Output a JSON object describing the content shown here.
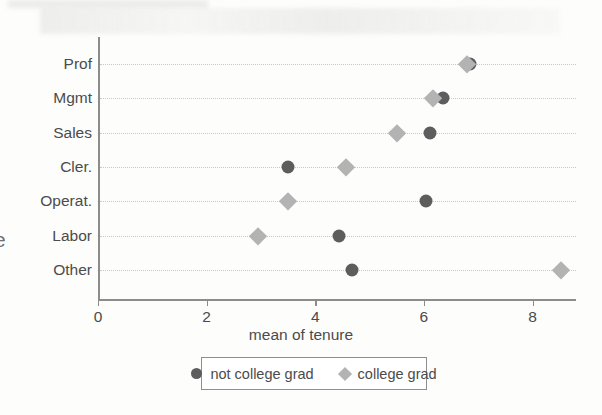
{
  "figure": {
    "left_margin_glyph": "e",
    "background_color": "#fdfdfc"
  },
  "legend": {
    "items": [
      {
        "label": "not college grad",
        "marker": "circle-marker",
        "color": "#5d5d5d"
      },
      {
        "label": "college grad",
        "marker": "diamond-marker",
        "color": "#b3b3b3"
      }
    ]
  },
  "chart_data": {
    "type": "scatter",
    "orientation": "horizontal",
    "title": "",
    "xlabel": "mean of tenure",
    "ylabel": "",
    "categories": [
      "Prof",
      "Mgmt",
      "Sales",
      "Cler.",
      "Operat.",
      "Labor",
      "Other"
    ],
    "xlim": [
      0,
      8.8
    ],
    "xticks": [
      0,
      2,
      4,
      6,
      8
    ],
    "xticklabels": [
      "0",
      "2",
      "4",
      "6",
      "8"
    ],
    "grid": "horizontal-dotted",
    "legend_position": "below-axis",
    "series": [
      {
        "name": "not college grad",
        "marker": "circle",
        "color": "#5d5d5d",
        "values": [
          6.85,
          6.35,
          6.11,
          3.49,
          6.03,
          4.44,
          4.67
        ]
      },
      {
        "name": "college grad",
        "marker": "diamond",
        "color": "#b3b3b3",
        "values": [
          6.8,
          6.16,
          5.51,
          4.57,
          3.49,
          2.94,
          8.52
        ]
      }
    ]
  }
}
